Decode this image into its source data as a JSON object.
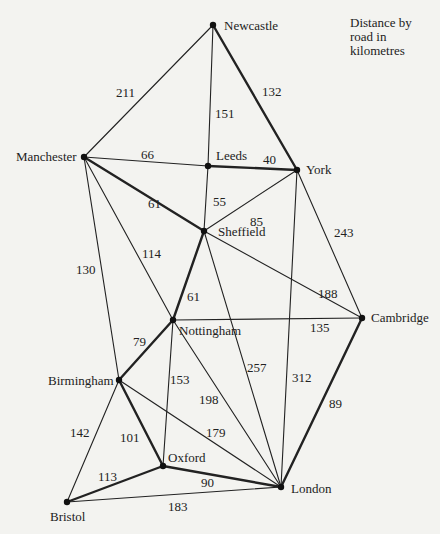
{
  "legend": {
    "line1": "Distance by",
    "line2": "road in",
    "line3": "kilometres"
  },
  "cities": [
    {
      "id": "newcastle",
      "name": "Newcastle",
      "x": 213,
      "y": 25,
      "lx": 224,
      "ly": 30
    },
    {
      "id": "manchester",
      "name": "Manchester",
      "x": 84,
      "y": 157,
      "lx": 16,
      "ly": 161
    },
    {
      "id": "leeds",
      "name": "Leeds",
      "x": 208,
      "y": 166,
      "lx": 216,
      "ly": 160
    },
    {
      "id": "york",
      "name": "York",
      "x": 297,
      "y": 170,
      "lx": 306,
      "ly": 174
    },
    {
      "id": "sheffield",
      "name": "Sheffield",
      "x": 204,
      "y": 231,
      "lx": 218,
      "ly": 236
    },
    {
      "id": "cambridge",
      "name": "Cambridge",
      "x": 362,
      "y": 318,
      "lx": 371,
      "ly": 322
    },
    {
      "id": "nottingham",
      "name": "Nottingham",
      "x": 173,
      "y": 320,
      "lx": 179,
      "ly": 335
    },
    {
      "id": "birmingham",
      "name": "Birmingham",
      "x": 119,
      "y": 380,
      "lx": 48,
      "ly": 385
    },
    {
      "id": "oxford",
      "name": "Oxford",
      "x": 163,
      "y": 466,
      "lx": 168,
      "ly": 462
    },
    {
      "id": "london",
      "name": "London",
      "x": 281,
      "y": 487,
      "lx": 291,
      "ly": 493
    },
    {
      "id": "bristol",
      "name": "Bristol",
      "x": 67,
      "y": 502,
      "lx": 50,
      "ly": 521
    }
  ],
  "edges": [
    {
      "from": "newcastle",
      "to": "manchester",
      "km": "211",
      "bold": false,
      "lx": 116,
      "ly": 97
    },
    {
      "from": "newcastle",
      "to": "leeds",
      "km": "151",
      "bold": false,
      "lx": 215,
      "ly": 118
    },
    {
      "from": "newcastle",
      "to": "york",
      "km": "132",
      "bold": true,
      "lx": 262,
      "ly": 96
    },
    {
      "from": "manchester",
      "to": "leeds",
      "km": "66",
      "bold": false,
      "lx": 141,
      "ly": 159
    },
    {
      "from": "leeds",
      "to": "york",
      "km": "40",
      "bold": true,
      "lx": 263,
      "ly": 164
    },
    {
      "from": "manchester",
      "to": "sheffield",
      "km": "61",
      "bold": true,
      "lx": 148,
      "ly": 208
    },
    {
      "from": "leeds",
      "to": "sheffield",
      "km": "55",
      "bold": false,
      "lx": 213,
      "ly": 206
    },
    {
      "from": "york",
      "to": "sheffield",
      "km": "85",
      "bold": false,
      "lx": 250,
      "ly": 226
    },
    {
      "from": "york",
      "to": "cambridge",
      "km": "243",
      "bold": false,
      "lx": 334,
      "ly": 237
    },
    {
      "from": "york",
      "to": "london",
      "km": "312",
      "bold": false,
      "lx": 292,
      "ly": 382
    },
    {
      "from": "manchester",
      "to": "nottingham",
      "km": "114",
      "bold": false,
      "lx": 142,
      "ly": 258
    },
    {
      "from": "manchester",
      "to": "birmingham",
      "km": "130",
      "bold": false,
      "lx": 76,
      "ly": 274
    },
    {
      "from": "sheffield",
      "to": "nottingham",
      "km": "61",
      "bold": true,
      "lx": 187,
      "ly": 301
    },
    {
      "from": "sheffield",
      "to": "cambridge",
      "km": "188",
      "bold": false,
      "lx": 318,
      "ly": 298
    },
    {
      "from": "sheffield",
      "to": "london",
      "km": "257",
      "bold": false,
      "lx": 247,
      "ly": 372
    },
    {
      "from": "nottingham",
      "to": "cambridge",
      "km": "135",
      "bold": false,
      "lx": 310,
      "ly": 332
    },
    {
      "from": "nottingham",
      "to": "birmingham",
      "km": "79",
      "bold": true,
      "lx": 133,
      "ly": 346
    },
    {
      "from": "nottingham",
      "to": "oxford",
      "km": "153",
      "bold": false,
      "lx": 170,
      "ly": 384
    },
    {
      "from": "nottingham",
      "to": "london",
      "km": "198",
      "bold": false,
      "lx": 199,
      "ly": 404
    },
    {
      "from": "birmingham",
      "to": "london",
      "km": "179",
      "bold": false,
      "lx": 206,
      "ly": 437
    },
    {
      "from": "birmingham",
      "to": "oxford",
      "km": "101",
      "bold": true,
      "lx": 120,
      "ly": 442
    },
    {
      "from": "birmingham",
      "to": "bristol",
      "km": "142",
      "bold": false,
      "lx": 70,
      "ly": 437
    },
    {
      "from": "oxford",
      "to": "bristol",
      "km": "113",
      "bold": true,
      "lx": 98,
      "ly": 481
    },
    {
      "from": "oxford",
      "to": "london",
      "km": "90",
      "bold": true,
      "lx": 201,
      "ly": 487
    },
    {
      "from": "bristol",
      "to": "london",
      "km": "183",
      "bold": false,
      "lx": 168,
      "ly": 511
    },
    {
      "from": "cambridge",
      "to": "london",
      "km": "89",
      "bold": true,
      "lx": 329,
      "ly": 408
    }
  ]
}
